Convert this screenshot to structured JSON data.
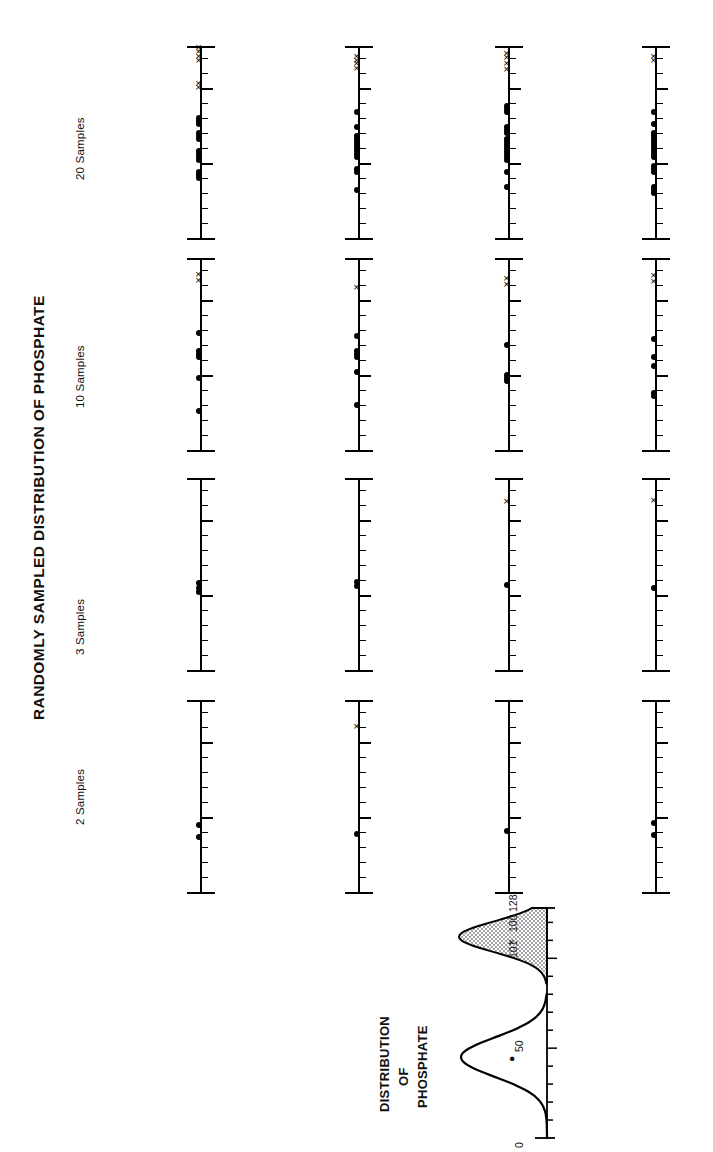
{
  "figure": {
    "title": "RANDOMLY SAMPLED DISTRIBUTION OF PHOSPHATE",
    "orientation": "rotated-90",
    "column_labels": [
      "2 Samples",
      "3 Samples",
      "10 Samples",
      "20 Samples"
    ],
    "inset_title_lines": [
      "DISTRIBUTION",
      "OF",
      "PHOSPHATE"
    ],
    "inset_axis_labels": [
      "0",
      "50",
      "101",
      "100",
      "128"
    ],
    "marker_legend": {
      "dot": "●",
      "cross": "×"
    },
    "colors": {
      "ink": "#000000",
      "paper": "#ffffff",
      "fill_stipple": "#b8b8b8"
    }
  },
  "chart_data": {
    "type": "scatter",
    "title": "RANDOMLY SAMPLED DISTRIBUTION OF PHOSPHATE",
    "xlabel": "Phosphate concentration",
    "ylabel": "",
    "xlim": [
      0,
      128
    ],
    "grid": false,
    "legend": [
      "● sample value",
      "× sample value (upper mode)"
    ],
    "axis_ticks": [
      0,
      10,
      20,
      30,
      40,
      50,
      60,
      70,
      80,
      90,
      100,
      110,
      120,
      128
    ],
    "major_ticks": [
      0,
      50,
      100,
      128
    ],
    "panels": [
      {
        "column": "2 Samples",
        "row": 1,
        "dots": [
          37,
          45
        ],
        "crosses": []
      },
      {
        "column": "2 Samples",
        "row": 2,
        "dots": [
          39
        ],
        "crosses": [
          110
        ]
      },
      {
        "column": "2 Samples",
        "row": 3,
        "dots": [
          41
        ],
        "crosses": []
      },
      {
        "column": "2 Samples",
        "row": 4,
        "dots": [
          38,
          46
        ],
        "crosses": []
      },
      {
        "column": "3 Samples",
        "row": 1,
        "dots": [
          52,
          55,
          58
        ],
        "crosses": []
      },
      {
        "column": "3 Samples",
        "row": 2,
        "dots": [
          56,
          59
        ],
        "crosses": []
      },
      {
        "column": "3 Samples",
        "row": 3,
        "dots": [
          57
        ],
        "crosses": [
          112
        ]
      },
      {
        "column": "3 Samples",
        "row": 4,
        "dots": [
          55
        ],
        "crosses": [
          113
        ]
      },
      {
        "column": "10 Samples",
        "row": 1,
        "dots": [
          26,
          48,
          62,
          64,
          66,
          78
        ],
        "crosses": [
          113,
          117
        ]
      },
      {
        "column": "10 Samples",
        "row": 2,
        "dots": [
          30,
          52,
          62,
          64,
          66,
          76
        ],
        "crosses": [
          108
        ]
      },
      {
        "column": "10 Samples",
        "row": 3,
        "dots": [
          46,
          48,
          50,
          70
        ],
        "crosses": [
          110,
          114
        ]
      },
      {
        "column": "10 Samples",
        "row": 4,
        "dots": [
          36,
          38,
          56,
          62,
          74
        ],
        "crosses": [
          112,
          116
        ]
      },
      {
        "column": "20 Samples",
        "row": 1,
        "dots": [
          40,
          42,
          44,
          52,
          54,
          56,
          58,
          66,
          68,
          70,
          76,
          78,
          80
        ],
        "crosses": [
          100,
          103,
          118,
          121,
          124,
          127
        ]
      },
      {
        "column": "20 Samples",
        "row": 2,
        "dots": [
          32,
          44,
          46,
          54,
          56,
          58,
          60,
          62,
          64,
          66,
          68,
          74,
          84
        ],
        "crosses": [
          113,
          116,
          118,
          121
        ]
      },
      {
        "column": "20 Samples",
        "row": 3,
        "dots": [
          34,
          44,
          52,
          54,
          56,
          58,
          60,
          62,
          64,
          66,
          70,
          72,
          74,
          84,
          86,
          88
        ],
        "crosses": [
          112,
          116,
          120,
          123
        ]
      },
      {
        "column": "20 Samples",
        "row": 4,
        "dots": [
          30,
          32,
          34,
          44,
          46,
          48,
          54,
          56,
          58,
          60,
          62,
          64,
          66,
          68,
          70,
          76,
          84
        ],
        "crosses": [
          118,
          121
        ]
      }
    ],
    "inset": {
      "type": "area",
      "title_lines": [
        "DISTRIBUTION",
        "OF",
        "PHOSPHATE"
      ],
      "axis_labels": [
        "0",
        "50",
        "101",
        "100",
        "128"
      ],
      "modes": [
        {
          "name": "lower mode",
          "center": 45,
          "filled": false
        },
        {
          "name": "upper mode",
          "center": 112,
          "filled": true
        }
      ],
      "xlim": [
        0,
        128
      ]
    }
  }
}
